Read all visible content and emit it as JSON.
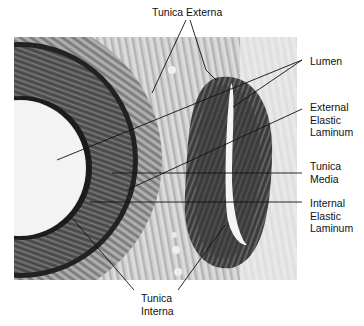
{
  "figure": {
    "background": "#ffffff",
    "image_region": {
      "x": 14,
      "y": 37,
      "width": 283,
      "height": 243
    },
    "tones": {
      "dark_wall": "#3a3a3a",
      "mid_wall": "#6e6e6e",
      "connective": "#b8b8b8",
      "lumen": "#f2f2f2",
      "elastic_line": "#1a1a1a"
    }
  },
  "labels": {
    "tunica_externa": {
      "lines": [
        "Tunica Externa"
      ]
    },
    "lumen": {
      "lines": [
        "Lumen"
      ]
    },
    "external_elastic_laminum": {
      "lines": [
        "External",
        "Elastic",
        "Laminum"
      ]
    },
    "tunica_media": {
      "lines": [
        "Tunica",
        "Media"
      ]
    },
    "internal_elastic_laminum": {
      "lines": [
        "Internal",
        "Elastic",
        "Laminum"
      ]
    },
    "tunica_interna": {
      "lines": [
        "Tunica",
        "Interna"
      ]
    }
  }
}
